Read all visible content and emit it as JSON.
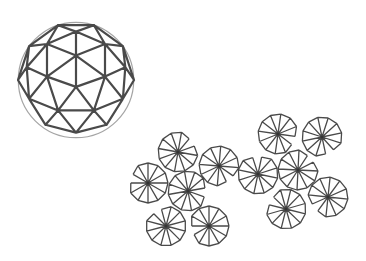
{
  "figure": {
    "width": 366,
    "height": 261,
    "background": "#ffffff",
    "stroke_color": "#4a4a4a"
  },
  "sphere": {
    "label": "geodesic-sphere",
    "center": [
      76,
      80
    ],
    "radius": 58,
    "frequency": 2,
    "stroke_width": 2.2
  },
  "rosettes": {
    "label": "rosette-cluster",
    "radius": 20,
    "segments": 12,
    "stroke_width": 1.3,
    "items": [
      {
        "cx": 178,
        "cy": 152,
        "rot": 10,
        "gap": 1
      },
      {
        "cx": 148,
        "cy": 183,
        "rot": 0,
        "gap": 9
      },
      {
        "cx": 188,
        "cy": 191,
        "rot": 20,
        "gap": 2
      },
      {
        "cx": 219,
        "cy": 166,
        "rot": 5,
        "gap": 4
      },
      {
        "cx": 166,
        "cy": 226,
        "rot": 15,
        "gap": 10
      },
      {
        "cx": 209,
        "cy": 226,
        "rot": 0,
        "gap": 8
      },
      {
        "cx": 258,
        "cy": 174,
        "rot": 12,
        "gap": 11
      },
      {
        "cx": 278,
        "cy": 134,
        "rot": 8,
        "gap": 3
      },
      {
        "cx": 322,
        "cy": 137,
        "rot": 18,
        "gap": 4
      },
      {
        "cx": 298,
        "cy": 170,
        "rot": 3,
        "gap": 1
      },
      {
        "cx": 286,
        "cy": 209,
        "rot": 14,
        "gap": 9
      },
      {
        "cx": 328,
        "cy": 197,
        "rot": 6,
        "gap": 7
      }
    ]
  }
}
